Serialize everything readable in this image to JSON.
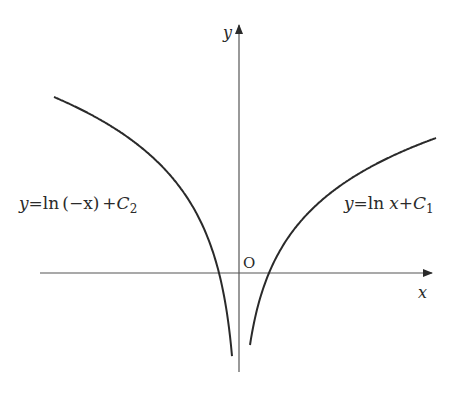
{
  "diagram": {
    "type": "function-graph",
    "axes": {
      "x_label": "x",
      "y_label": "y",
      "origin_label": "O"
    },
    "curves": [
      {
        "name": "ln-x-plus-c1",
        "label_parts": {
          "lhs": "y",
          "eq": "=",
          "fn": "ln",
          "arg": "x",
          "plus": "+",
          "const": "C",
          "sub": "1"
        },
        "domain": "x > 0"
      },
      {
        "name": "ln-neg-x-plus-c2",
        "label_parts": {
          "lhs": "y",
          "eq": "=",
          "fn": "ln",
          "arg": "(−x)",
          "plus": "+",
          "const": "C",
          "sub": "2"
        },
        "domain": "x < 0"
      }
    ],
    "colors": {
      "ink": "#2a2a2a",
      "background": "#ffffff"
    }
  }
}
